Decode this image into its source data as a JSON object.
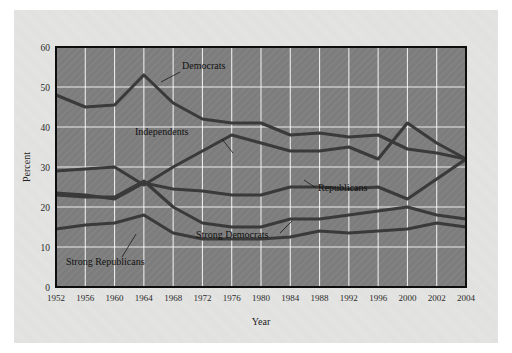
{
  "figure": {
    "background_color": "#ffffff",
    "panel_color": "#e4e4e2",
    "plot_background_color": "#7d7d7d",
    "grid_color": "#ffffff",
    "axis_color": "#000000",
    "series_color": "#3a3a3a"
  },
  "chart_data": {
    "type": "line",
    "title": "",
    "xlabel": "Year",
    "ylabel": "Percent",
    "ylim": [
      0,
      60
    ],
    "yticks": [
      0,
      10,
      20,
      30,
      40,
      50,
      60
    ],
    "grid": true,
    "legend_position": "inline-annotations",
    "categories": [
      "1952",
      "1956",
      "1960",
      "1964",
      "1968",
      "1972",
      "1976",
      "1980",
      "1984",
      "1988",
      "1992",
      "1996",
      "2000",
      "2002",
      "2004"
    ],
    "series": [
      {
        "name": "Democrats",
        "label": "Democrats",
        "values": [
          48,
          45,
          45.5,
          53,
          46,
          42,
          41,
          41,
          38,
          38.5,
          37.5,
          38,
          34.5,
          33.5,
          32
        ]
      },
      {
        "name": "Independents",
        "label": "Independents",
        "values": [
          29,
          29.5,
          30,
          25.5,
          30,
          34,
          38,
          36,
          34,
          34,
          35,
          32,
          41,
          36,
          32
        ]
      },
      {
        "name": "Republicans",
        "label": "Republicans",
        "values": [
          23.5,
          23,
          22,
          26,
          24.5,
          24,
          23,
          23,
          25,
          25,
          24.5,
          25,
          22,
          27,
          32
        ]
      },
      {
        "name": "Strong Democrats",
        "label": "Strong Democrats",
        "values": [
          23,
          22.5,
          22.5,
          26.5,
          20,
          16,
          15,
          15,
          17,
          17,
          18,
          19,
          20,
          18,
          17
        ]
      },
      {
        "name": "Strong Republicans",
        "label": "Strong Republicans",
        "values": [
          14.5,
          15.5,
          16,
          18,
          13.5,
          12,
          12,
          12,
          12.5,
          14,
          13.5,
          14,
          14.5,
          16,
          15
        ]
      }
    ],
    "annotations": [
      {
        "text": "Democrats",
        "target_series": "Democrats"
      },
      {
        "text": "Independents",
        "target_series": "Independents"
      },
      {
        "text": "Republicans",
        "target_series": "Republicans"
      },
      {
        "text": "Strong Democrats",
        "target_series": "Strong Democrats"
      },
      {
        "text": "Strong Republicans",
        "target_series": "Strong Republicans"
      }
    ]
  }
}
